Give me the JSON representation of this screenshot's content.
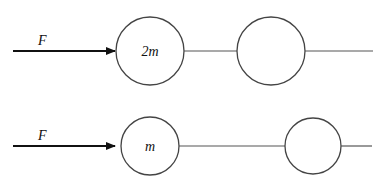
{
  "diagram": {
    "top_system": {
      "force_label": "F",
      "mass1_label": "2m",
      "mass2_label": ""
    },
    "bottom_system": {
      "force_label": "F",
      "mass1_label": "m",
      "mass2_label": ""
    },
    "colors": {
      "line": "#555555",
      "arrow": "#111111",
      "background": "#ffffff"
    }
  }
}
